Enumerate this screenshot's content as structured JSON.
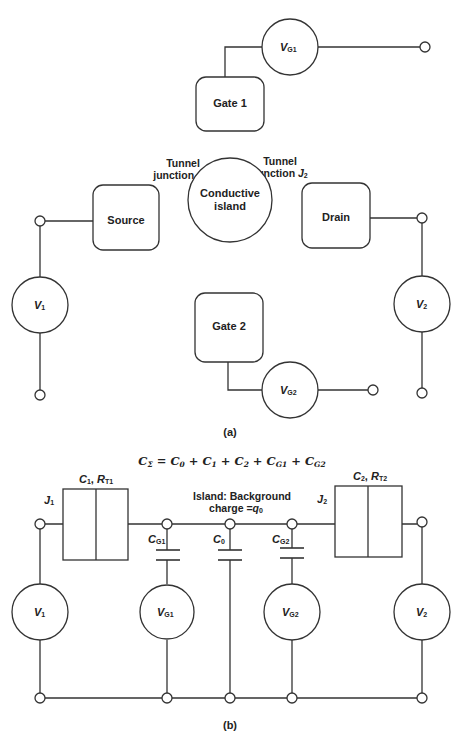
{
  "part_a": {
    "caption": "(a)",
    "gate1": {
      "label": "Gate 1"
    },
    "gate2": {
      "label": "Gate 2"
    },
    "source": {
      "label": "Source"
    },
    "drain": {
      "label": "Drain"
    },
    "island": {
      "line1": "Conductive",
      "line2": "island"
    },
    "junction1": {
      "line1": "Tunnel",
      "line2": "junction ",
      "sym": "J",
      "sub": "1"
    },
    "junction2": {
      "line1": "Tunnel",
      "line2": "junction ",
      "sym": "J",
      "sub": "2"
    },
    "vg1": {
      "sym": "V",
      "sub": "G1"
    },
    "vg2": {
      "sym": "V",
      "sub": "G2"
    },
    "v1": {
      "sym": "V",
      "sub": "1"
    },
    "v2": {
      "sym": "V",
      "sub": "2"
    }
  },
  "part_b": {
    "caption": "(b)",
    "formula": "CΣ = C0 + C1 + C2 + CG1 + CG2",
    "formula_parts": {
      "lhs": "C",
      "lhs_sub": "Σ",
      "t0": "C",
      "t0_sub": "0",
      "t1": "C",
      "t1_sub": "1",
      "t2": "C",
      "t2_sub": "2",
      "t3": "C",
      "t3_sub": "G1",
      "t4": "C",
      "t4_sub": "G2",
      "eq": " = ",
      "plus": " + "
    },
    "j1": {
      "sym": "J",
      "sub": "1"
    },
    "j2": {
      "sym": "J",
      "sub": "2"
    },
    "c1_rt1": {
      "c": "C",
      "c_sub": "1",
      "sep": ", ",
      "r": "R",
      "r_sub": "T1"
    },
    "c2_rt2": {
      "c": "C",
      "c_sub": "2",
      "sep": ", ",
      "r": "R",
      "r_sub": "T2"
    },
    "island_label": {
      "line1": "Island: Background",
      "line2": "charge =",
      "q": "q",
      "q_sub": "0"
    },
    "cg1": {
      "sym": "C",
      "sub": "G1"
    },
    "c0": {
      "sym": "C",
      "sub": "0"
    },
    "cg2": {
      "sym": "C",
      "sub": "G2"
    },
    "v1": {
      "sym": "V",
      "sub": "1"
    },
    "vg1": {
      "sym": "V",
      "sub": "G1"
    },
    "vg2": {
      "sym": "V",
      "sub": "G2"
    },
    "v2": {
      "sym": "V",
      "sub": "2"
    }
  }
}
